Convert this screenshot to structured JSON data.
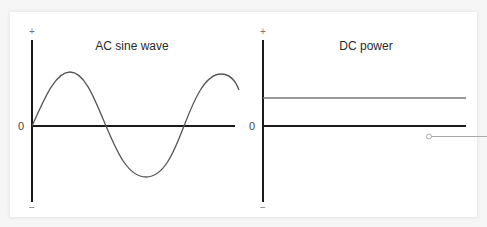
{
  "figure": {
    "left_panel": {
      "title": "AC sine wave",
      "y_plus_label": "+",
      "y_minus_label": "−",
      "zero_label": "0"
    },
    "right_panel": {
      "title": "DC power",
      "y_plus_label": "+",
      "y_minus_label": "−",
      "zero_label": "0"
    },
    "colors": {
      "axis": "#1a1a1a",
      "curve": "#555555",
      "dc_line": "#777777",
      "callout": "#aaaaaa",
      "background": "#ffffff"
    },
    "callout": {
      "marker": "circle-marker",
      "points_to": "right-edge"
    }
  }
}
